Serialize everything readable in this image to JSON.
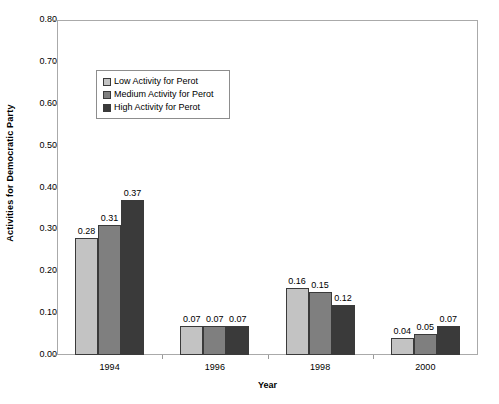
{
  "chart_data": {
    "type": "bar",
    "title": "",
    "xlabel": "Year",
    "ylabel": "Activities for Democratic Party",
    "categories": [
      "1994",
      "1996",
      "1998",
      "2000"
    ],
    "ylim": [
      0.0,
      0.8
    ],
    "ytick_labels": [
      "0.80",
      "0.70",
      "0.60",
      "0.50",
      "0.40",
      "0.30",
      "0.20",
      "0.10",
      "0.00"
    ],
    "ytick_values": [
      0.8,
      0.7,
      0.6,
      0.5,
      0.4,
      0.3,
      0.2,
      0.1,
      0.0
    ],
    "grid": false,
    "legend_position": "upper-left-inside",
    "series": [
      {
        "name": "Low Activity for Perot",
        "color": "#c3c3c3",
        "values": [
          0.28,
          0.07,
          0.16,
          0.04
        ],
        "labels": [
          "0.28",
          "0.07",
          "0.16",
          "0.04"
        ]
      },
      {
        "name": "Medium Activity for Perot",
        "color": "#7f7f7f",
        "values": [
          0.31,
          0.07,
          0.15,
          0.05
        ],
        "labels": [
          "0.31",
          "0.07",
          "0.15",
          "0.05"
        ]
      },
      {
        "name": "High Activity for Perot",
        "color": "#3a3a3a",
        "values": [
          0.37,
          0.07,
          0.12,
          0.07
        ],
        "labels": [
          "0.37",
          "0.07",
          "0.12",
          "0.07"
        ]
      }
    ]
  },
  "legend": {
    "items": [
      {
        "label": "Low Activity for Perot",
        "color": "#c3c3c3"
      },
      {
        "label": "Medium Activity for Perot",
        "color": "#7f7f7f"
      },
      {
        "label": "High Activity for Perot",
        "color": "#3a3a3a"
      }
    ]
  }
}
